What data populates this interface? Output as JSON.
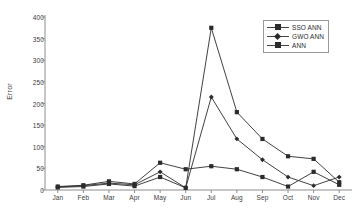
{
  "chart_data": {
    "type": "line",
    "title": "",
    "xlabel": "",
    "ylabel": "Error",
    "ylim": [
      0,
      400
    ],
    "yticks": [
      0,
      50,
      100,
      150,
      200,
      250,
      300,
      350,
      400
    ],
    "grid": false,
    "legend_position": "top-right",
    "categories": [
      "Jan",
      "Feb",
      "Mar",
      "Apr",
      "May",
      "Jun",
      "Jul",
      "Aug",
      "Sep",
      "Oct",
      "Nov",
      "Dec"
    ],
    "series": [
      {
        "name": "SSO ANN",
        "marker": "square",
        "color": "#2b2b2b",
        "values": [
          6,
          8,
          14,
          9,
          30,
          5,
          375,
          180,
          118,
          78,
          72,
          18
        ]
      },
      {
        "name": "GWO ANN",
        "marker": "diamond",
        "color": "#2b2b2b",
        "values": [
          7,
          10,
          16,
          12,
          42,
          5,
          215,
          118,
          70,
          30,
          10,
          30
        ]
      },
      {
        "name": "ANN",
        "marker": "square",
        "color": "#2b2b2b",
        "values": [
          8,
          11,
          20,
          14,
          63,
          48,
          55,
          48,
          30,
          8,
          42,
          12
        ]
      }
    ]
  },
  "axes": {
    "y_title": "Error",
    "y_tick_labels": [
      "400",
      "350",
      "300",
      "250",
      "200",
      "150",
      "100",
      "50",
      "0"
    ],
    "x_tick_labels": [
      "Jan",
      "Feb",
      "Mar",
      "Apr",
      "May",
      "Jun",
      "Jul",
      "Aug",
      "Sep",
      "Oct",
      "Nov",
      "Dec"
    ]
  },
  "legend": {
    "entries": [
      {
        "label": "SSO ANN"
      },
      {
        "label": "GWO ANN"
      },
      {
        "label": "ANN"
      }
    ]
  }
}
